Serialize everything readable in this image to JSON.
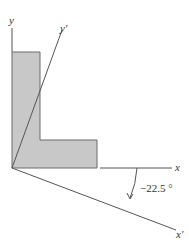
{
  "figure": {
    "axes": {
      "y": "y",
      "y_prime": "y'",
      "x": "x",
      "x_prime": "x'"
    },
    "angle_label": "−22.5 °",
    "shape": "L-shaped cross section",
    "colors": {
      "fill": "#c8c8c8",
      "stroke": "#6a6a6a",
      "axis": "#555555"
    }
  }
}
